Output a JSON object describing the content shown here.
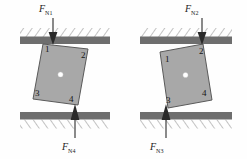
{
  "figure": {
    "type": "free-body-diagram",
    "background_color": "#fefefe",
    "block_fill": "#a8a8a8",
    "block_stroke": "#4a4a4a",
    "wall_fill": "#6e6e6e",
    "hatch_color": "#8f8f8f",
    "arrow_color": "#2a2a2a",
    "com_dot_color": "#ffffff"
  },
  "panels": [
    {
      "id": "left",
      "name": "left-diagram",
      "block_tilt_deg": -8,
      "forces": [
        {
          "id": "FN1",
          "symbol": "F",
          "subscript": "N1",
          "direction": "down",
          "applied_at_corner": "1",
          "location": "top-wall",
          "label_x": 40,
          "label_y": 4
        },
        {
          "id": "FN4",
          "symbol": "F",
          "subscript": "N4",
          "direction": "up",
          "applied_at_corner": "4",
          "location": "bottom-wall",
          "label_x": 63,
          "label_y": 142
        }
      ],
      "corners": [
        {
          "label": "1",
          "x": 45,
          "y": 47,
          "position": "top-left"
        },
        {
          "label": "2",
          "x": 82,
          "y": 52,
          "position": "top-right"
        },
        {
          "label": "3",
          "x": 35,
          "y": 94,
          "position": "bottom-left"
        },
        {
          "label": "4",
          "x": 72,
          "y": 100,
          "position": "bottom-right"
        }
      ],
      "center_of_mass": {
        "x": 60,
        "y": 75
      }
    },
    {
      "id": "right",
      "name": "right-diagram",
      "block_tilt_deg": 8,
      "forces": [
        {
          "id": "FN2",
          "symbol": "F",
          "subscript": "N2",
          "direction": "down",
          "applied_at_corner": "2",
          "location": "top-wall",
          "label_x": 186,
          "label_y": 4
        },
        {
          "id": "FN3",
          "symbol": "F",
          "subscript": "N3",
          "direction": "up",
          "applied_at_corner": "3",
          "location": "bottom-wall",
          "label_x": 170,
          "label_y": 142
        }
      ],
      "corners": [
        {
          "label": "1",
          "x": 166,
          "y": 56,
          "position": "top-left"
        },
        {
          "label": "2",
          "x": 202,
          "y": 46,
          "position": "top-right"
        },
        {
          "label": "3",
          "x": 157,
          "y": 101,
          "position": "bottom-left"
        },
        {
          "label": "4",
          "x": 203,
          "y": 93,
          "position": "bottom-right"
        }
      ],
      "center_of_mass": {
        "x": 182,
        "y": 74
      }
    }
  ],
  "walls": {
    "top": {
      "y": 36,
      "height": 8,
      "hatch_side": "above"
    },
    "bottom": {
      "y": 112,
      "height": 8,
      "hatch_side": "below"
    },
    "left_span": [
      20,
      110
    ],
    "right_span": [
      140,
      232
    ]
  }
}
